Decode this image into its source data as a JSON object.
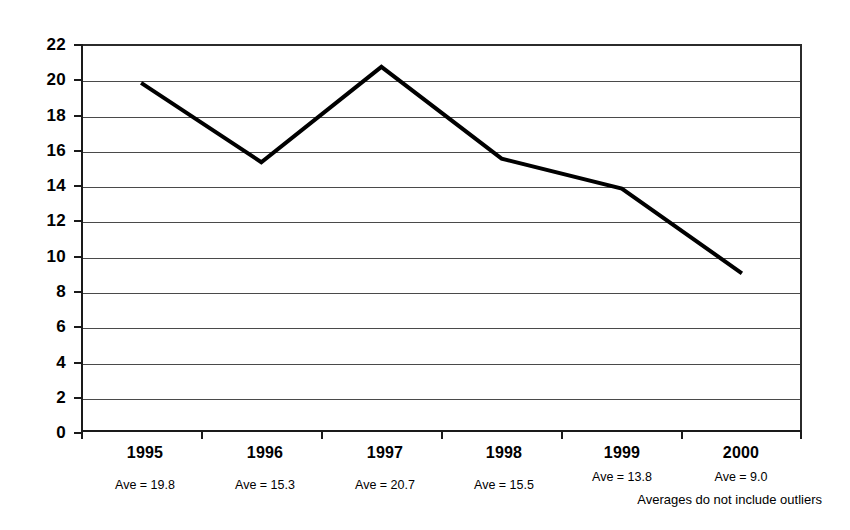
{
  "chart_data": {
    "type": "line",
    "title": "",
    "subtitle": "",
    "xlabel": "",
    "ylabel": "",
    "categories": [
      "1995",
      "1996",
      "1997",
      "1998",
      "1999",
      "2000"
    ],
    "values": [
      19.8,
      15.3,
      20.7,
      15.5,
      13.8,
      9.0
    ],
    "series": [
      {
        "name": "",
        "values": [
          19.8,
          15.3,
          20.7,
          15.5,
          13.8,
          9.0
        ]
      }
    ],
    "point_labels": [
      "Ave = 19.8",
      "Ave = 15.3",
      "Ave = 20.7",
      "Ave = 15.5",
      "Ave = 13.8",
      "Ave = 9.0"
    ],
    "ylim": [
      0,
      22
    ],
    "ytick_values": [
      0,
      2,
      4,
      6,
      8,
      10,
      12,
      14,
      16,
      18,
      20,
      22
    ],
    "ytick_labels": [
      "0",
      "2",
      "4",
      "6",
      "8",
      "10",
      "12",
      "14",
      "16",
      "18",
      "20",
      "22"
    ],
    "ytick_step": 2,
    "grid": true,
    "grid_axis": "y",
    "legend": false,
    "legend_position": "none",
    "annotations": [
      "Averages do not include outliers"
    ],
    "line_color": "#000000",
    "line_width": 4,
    "markers": false,
    "plot_background": "#ffffff",
    "grid_color": "#4a4a4a",
    "axis_color": "#1a1a1a"
  },
  "footnote": {
    "text": "Averages do not include outliers"
  },
  "axis": {
    "y_labels": [
      "22",
      "20",
      "18",
      "16",
      "14",
      "12",
      "10",
      "8",
      "6",
      "4",
      "2",
      "0"
    ],
    "x_categories": [
      {
        "year": "1995",
        "ave": "Ave = 19.8"
      },
      {
        "year": "1996",
        "ave": "Ave = 15.3"
      },
      {
        "year": "1997",
        "ave": "Ave = 20.7"
      },
      {
        "year": "1998",
        "ave": "Ave = 15.5"
      },
      {
        "year": "1999",
        "ave": "Ave = 13.8"
      },
      {
        "year": "2000",
        "ave": "Ave = 9.0"
      }
    ]
  }
}
